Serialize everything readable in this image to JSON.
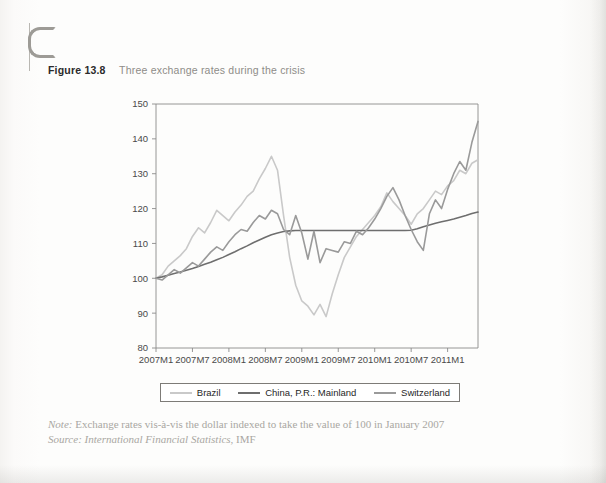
{
  "page": {
    "edge_mark": "c-page-edge-mark"
  },
  "figure": {
    "label": "Figure 13.8",
    "title": "Three exchange rates during the crisis"
  },
  "legend": {
    "position": "below-axis",
    "items": [
      {
        "label": "Brazil",
        "color": "#c9c9c9"
      },
      {
        "label": "China, P.R.: Mainland",
        "color": "#6e6e6e"
      },
      {
        "label": "Switzerland",
        "color": "#9a9a9a"
      }
    ]
  },
  "notes": {
    "note_key": "Note:",
    "note_text": " Exchange rates vis-à-vis the dollar indexed to take the value of 100 in January 2007",
    "source_key": "Source:",
    "source_title": " International Financial Statistics",
    "source_tail": ", IMF"
  },
  "chart_data": {
    "type": "line",
    "title": "Three exchange rates during the crisis",
    "xlabel": "",
    "ylabel": "",
    "ylim": [
      80,
      150
    ],
    "yticks": [
      80,
      90,
      100,
      110,
      120,
      130,
      140,
      150
    ],
    "grid": false,
    "legend_position": "bottom",
    "xtick_labels": [
      "2007M1",
      "2007M7",
      "2008M1",
      "2008M7",
      "2009M1",
      "2009M7",
      "2010M1",
      "2010M7",
      "2011M1"
    ],
    "xtick_indices": [
      0,
      6,
      12,
      18,
      24,
      30,
      36,
      42,
      48
    ],
    "x_count": 54,
    "series": [
      {
        "name": "Brazil",
        "color": "#c9c9c9",
        "width": 1.6,
        "values": [
          100.0,
          101.0,
          103.5,
          105.0,
          106.5,
          108.5,
          112.0,
          114.5,
          113.0,
          116.0,
          119.5,
          118.0,
          116.5,
          119.0,
          121.0,
          123.5,
          125.0,
          128.5,
          131.5,
          135.0,
          131.0,
          118.0,
          106.0,
          98.0,
          93.5,
          92.0,
          89.5,
          92.5,
          89.0,
          95.5,
          101.0,
          106.0,
          109.0,
          112.0,
          114.0,
          116.0,
          118.0,
          120.5,
          124.5,
          122.0,
          120.0,
          118.0,
          115.5,
          118.5,
          120.0,
          122.5,
          125.0,
          124.0,
          126.5,
          128.0,
          131.0,
          130.0,
          133.0,
          134.0
        ]
      },
      {
        "name": "China, P.R.: Mainland",
        "color": "#6e6e6e",
        "width": 1.6,
        "values": [
          100.0,
          100.4,
          100.9,
          101.4,
          101.8,
          102.3,
          102.8,
          103.4,
          104.0,
          104.6,
          105.3,
          106.0,
          106.8,
          107.6,
          108.5,
          109.3,
          110.2,
          111.0,
          111.8,
          112.5,
          113.0,
          113.4,
          113.6,
          113.7,
          113.7,
          113.7,
          113.7,
          113.7,
          113.7,
          113.7,
          113.7,
          113.7,
          113.7,
          113.7,
          113.7,
          113.7,
          113.7,
          113.7,
          113.7,
          113.7,
          113.7,
          113.7,
          113.8,
          114.2,
          114.8,
          115.3,
          115.8,
          116.2,
          116.6,
          117.0,
          117.5,
          118.0,
          118.6,
          119.0
        ]
      },
      {
        "name": "Switzerland",
        "color": "#9a9a9a",
        "width": 1.6,
        "values": [
          100.0,
          99.5,
          101.0,
          102.5,
          101.5,
          103.0,
          104.5,
          103.5,
          105.5,
          107.5,
          109.0,
          108.0,
          110.5,
          112.5,
          114.0,
          113.5,
          116.0,
          118.0,
          117.0,
          119.5,
          118.5,
          114.0,
          112.5,
          118.0,
          113.0,
          105.5,
          113.5,
          104.5,
          108.5,
          108.0,
          107.5,
          110.5,
          110.0,
          113.5,
          112.5,
          114.5,
          117.0,
          120.0,
          123.5,
          126.0,
          122.5,
          118.0,
          114.0,
          110.5,
          108.0,
          118.5,
          122.5,
          120.0,
          125.5,
          130.0,
          133.5,
          131.0,
          139.0,
          145.0
        ]
      }
    ]
  }
}
